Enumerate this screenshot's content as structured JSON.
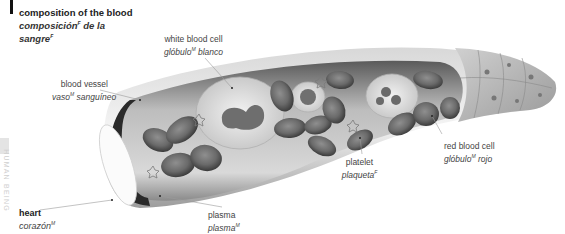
{
  "page": {
    "section_label": "HUMAN BEING",
    "title": {
      "en": "composition of the blood",
      "es_main": "composición",
      "es_gender": "F",
      "es_rest": " de la",
      "es_line2": "sangre",
      "es_line2_gender": "F"
    }
  },
  "labels": {
    "white_blood_cell": {
      "en": "white blood cell",
      "es": "glóbulo",
      "gender": "M",
      "es_rest": " blanco"
    },
    "blood_vessel": {
      "en": "blood vessel",
      "es": "vaso",
      "gender": "M",
      "es_rest": " sanguíneo"
    },
    "platelet": {
      "en": "platelet",
      "es": "plaqueta",
      "gender": "F"
    },
    "red_blood_cell": {
      "en": "red blood cell",
      "es": "glóbulo",
      "gender": "M",
      "es_rest": " rojo"
    },
    "plasma": {
      "en": "plasma",
      "es": "plasma",
      "gender": "M"
    },
    "heart": {
      "en": "heart",
      "es": "corazón",
      "gender": "M"
    }
  },
  "colors": {
    "ink": "#222222",
    "leader": "#9a9a9a",
    "vessel_dark": "#2a2a2a",
    "cell_mid": "#6e6e6e",
    "background": "#ffffff"
  }
}
